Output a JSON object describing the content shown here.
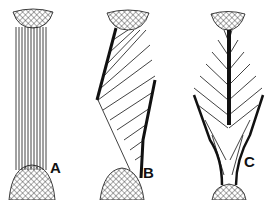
{
  "figure": {
    "panels": [
      {
        "label": "A",
        "type": "parallel-fibers"
      },
      {
        "label": "B",
        "type": "unipennate-fibers"
      },
      {
        "label": "C",
        "type": "bipennate-fibers"
      }
    ],
    "colors": {
      "ink": "#111111",
      "background": "#ffffff"
    }
  }
}
